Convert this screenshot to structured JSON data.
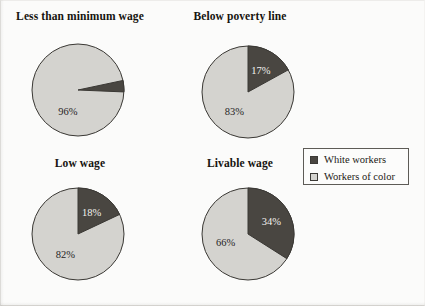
{
  "figure": {
    "background_color": "#fbfbfa"
  },
  "colors": {
    "dark_slice": "#494641",
    "light_slice": "#d4d3cf",
    "outline": "#3a3834",
    "text": "#16140f"
  },
  "legend": {
    "entries": [
      {
        "label": "White workers",
        "swatch": "dark",
        "color": "#494641"
      },
      {
        "label": "Workers of color",
        "swatch": "light",
        "color": "#d4d3cf"
      }
    ]
  },
  "chart_data": [
    {
      "type": "pie",
      "title": "Less than minimum wage",
      "labels": [
        "White workers",
        "Workers of color"
      ],
      "values": [
        4,
        96
      ],
      "value_labels": [
        "4%",
        "96%"
      ],
      "colors": [
        "#494641",
        "#d4d3cf"
      ],
      "legend_position": "right-center",
      "units": "percent"
    },
    {
      "type": "pie",
      "title": "Below poverty line",
      "labels": [
        "White workers",
        "Workers of color"
      ],
      "values": [
        17,
        83
      ],
      "value_labels": [
        "17%",
        "83%"
      ],
      "colors": [
        "#494641",
        "#d4d3cf"
      ],
      "legend_position": "right-center",
      "units": "percent"
    },
    {
      "type": "pie",
      "title": "Low wage",
      "labels": [
        "White workers",
        "Workers of color"
      ],
      "values": [
        18,
        82
      ],
      "value_labels": [
        "18%",
        "82%"
      ],
      "colors": [
        "#494641",
        "#d4d3cf"
      ],
      "legend_position": "right-center",
      "units": "percent"
    },
    {
      "type": "pie",
      "title": "Livable wage",
      "labels": [
        "White workers",
        "Workers of color"
      ],
      "values": [
        34,
        66
      ],
      "value_labels": [
        "34%",
        "66%"
      ],
      "colors": [
        "#494641",
        "#d4d3cf"
      ],
      "legend_position": "right-center",
      "units": "percent"
    }
  ]
}
